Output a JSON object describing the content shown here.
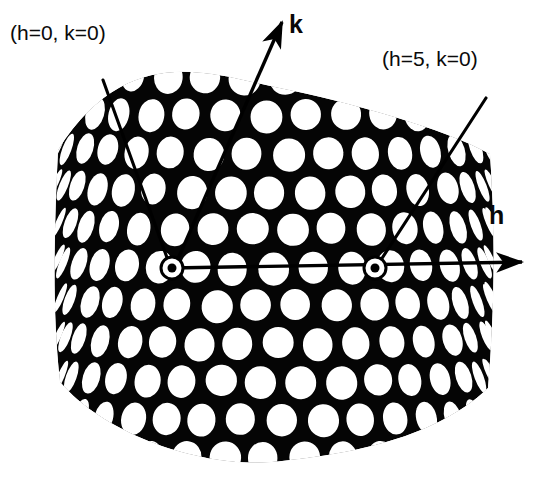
{
  "figure": {
    "kind": "electron-micrograph-lattice-indexing",
    "background_color": "#ffffff",
    "lattice_color": "#000000",
    "pore_color": "#ffffff",
    "annotation_color": "#000000"
  },
  "labels": {
    "origin_index": "(h=0, k=0)",
    "fifth_order_index": "(h=5, k=0)",
    "k_axis": "k",
    "h_axis": "h"
  },
  "markers": {
    "origin": {
      "x": 172,
      "y": 268,
      "ring_radius": 11,
      "dot_radius": 4.5
    },
    "h5": {
      "x": 375,
      "y": 268,
      "ring_radius": 11,
      "dot_radius": 4.5
    }
  },
  "axes": {
    "h": {
      "label": "h",
      "start_x": 172,
      "start_y": 268,
      "end_x": 522,
      "end_y": 262,
      "order_span": 5,
      "span_start_index": 0,
      "span_end_index": 5
    },
    "k": {
      "label": "k",
      "start_x": 174,
      "start_y": 268,
      "end_x": 282,
      "end_y": 22
    }
  },
  "leaders": [
    {
      "name": "leader-origin",
      "x1": 103,
      "y1": 80,
      "x2": 170,
      "y2": 266
    },
    {
      "name": "leader-h5",
      "x1": 486,
      "y1": 98,
      "x2": 377,
      "y2": 266
    }
  ],
  "lattice": {
    "type": "hexagonal",
    "a_spacing_px": 40.6,
    "rows": 11,
    "row_height_px": 38,
    "cylinder_center_x": 274,
    "cylinder_radius_px": 218,
    "pore_radius_px": 15.5,
    "top_edge_peak_y": 86,
    "top_edge_side_y": 150,
    "bottom_edge_dip_y": 462,
    "bottom_edge_side_y": 392,
    "left_edge_x": 58,
    "right_edge_x": 490
  }
}
